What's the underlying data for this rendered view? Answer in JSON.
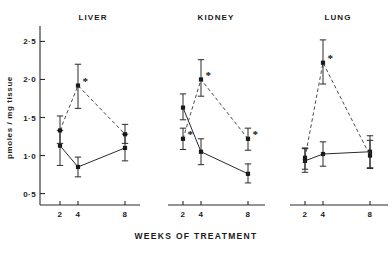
{
  "figure": {
    "y_axis_label": "pmoles / mg tissue",
    "x_axis_label": "WEEKS OF TREATMENT",
    "significance_marker": "*"
  },
  "panels": [
    {
      "title": "LIVER"
    },
    {
      "title": "KIDNEY"
    },
    {
      "title": "LUNG"
    }
  ],
  "y_ticks": [
    {
      "label": "2·5",
      "value": 2.5
    },
    {
      "label": "2·0",
      "value": 2.0
    },
    {
      "label": "1·5",
      "value": 1.5
    },
    {
      "label": "1·0",
      "value": 1.0
    },
    {
      "label": "0·5",
      "value": 0.5
    }
  ],
  "x_ticks": [
    {
      "label": "2",
      "value": 2
    },
    {
      "label": "4",
      "value": 4
    },
    {
      "label": "8",
      "value": 8
    }
  ],
  "chart_data": {
    "type": "line",
    "title": "",
    "subtitle": "",
    "xlabel": "WEEKS OF TREATMENT",
    "ylabel": "pmoles / mg tissue",
    "ylim": [
      0.35,
      2.65
    ],
    "yticks": [
      0.5,
      1.0,
      1.5,
      2.0,
      2.5
    ],
    "ytick_labels": [
      "0·5",
      "1·0",
      "1·5",
      "2·0",
      "2·5"
    ],
    "x": [
      2,
      4,
      8
    ],
    "xtick_labels": [
      "2",
      "4",
      "8"
    ],
    "grid": false,
    "legend": "none",
    "error_bars": "yes",
    "panels": [
      {
        "title": "LIVER",
        "series": [
          {
            "name": "control",
            "style": "solid",
            "marker": "filled-square",
            "values": [
              1.13,
              0.85,
              1.1
            ],
            "err_low": [
              0.87,
              0.72,
              0.93
            ],
            "err_high": [
              1.33,
              0.98,
              1.28
            ],
            "significant": [
              false,
              false,
              false
            ]
          },
          {
            "name": "treated",
            "style": "dashed",
            "marker": "filled-square",
            "values": [
              1.33,
              1.92,
              1.28
            ],
            "err_low": [
              1.16,
              1.62,
              1.16
            ],
            "err_high": [
              1.52,
              2.2,
              1.41
            ],
            "significant": [
              false,
              true,
              false
            ]
          }
        ]
      },
      {
        "title": "KIDNEY",
        "series": [
          {
            "name": "control",
            "style": "solid",
            "marker": "filled-square",
            "values": [
              1.63,
              1.05,
              0.76
            ],
            "err_low": [
              1.47,
              0.88,
              0.64
            ],
            "err_high": [
              1.81,
              1.22,
              0.89
            ],
            "significant": [
              false,
              false,
              false
            ]
          },
          {
            "name": "treated",
            "style": "dashed",
            "marker": "filled-square",
            "values": [
              1.22,
              2.0,
              1.22
            ],
            "err_low": [
              1.08,
              1.78,
              1.07
            ],
            "err_high": [
              1.36,
              2.26,
              1.36
            ],
            "significant": [
              true,
              true,
              true
            ]
          }
        ]
      },
      {
        "title": "LUNG",
        "series": [
          {
            "name": "control",
            "style": "solid",
            "marker": "filled-square",
            "values": [
              0.93,
              1.02,
              1.05
            ],
            "err_low": [
              0.78,
              0.86,
              0.83
            ],
            "err_high": [
              1.1,
              1.18,
              1.26
            ],
            "significant": [
              false,
              false,
              false
            ]
          },
          {
            "name": "treated",
            "style": "dashed",
            "marker": "filled-square",
            "values": [
              0.97,
              2.22,
              1.0
            ],
            "err_low": [
              0.82,
              1.94,
              0.84
            ],
            "err_high": [
              1.09,
              2.52,
              1.2
            ],
            "significant": [
              false,
              true,
              false
            ]
          }
        ]
      }
    ]
  }
}
